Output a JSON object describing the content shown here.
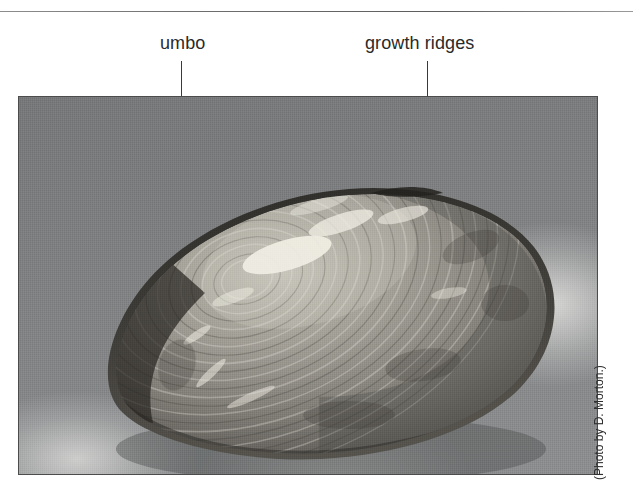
{
  "figure": {
    "labels": [
      {
        "id": "umbo",
        "text": "umbo"
      },
      {
        "id": "growth-ridges",
        "text": "growth ridges"
      }
    ],
    "photo": {
      "subject": "freshwater mussel bivalve shell, exterior view",
      "credit": "(Photo by D. Morton.)"
    },
    "colors": {
      "rule": "#6f6f6f",
      "leader_line": "#3a3a3a",
      "label_text": "#2a2a2a",
      "photo_background": "#7e8081",
      "photo_border": "#4c4c4c",
      "shell_light": "#b9b6ae",
      "shell_mid": "#8d8a84",
      "shell_dark": "#3a3833",
      "credit_text": "#2f2f2f"
    }
  }
}
